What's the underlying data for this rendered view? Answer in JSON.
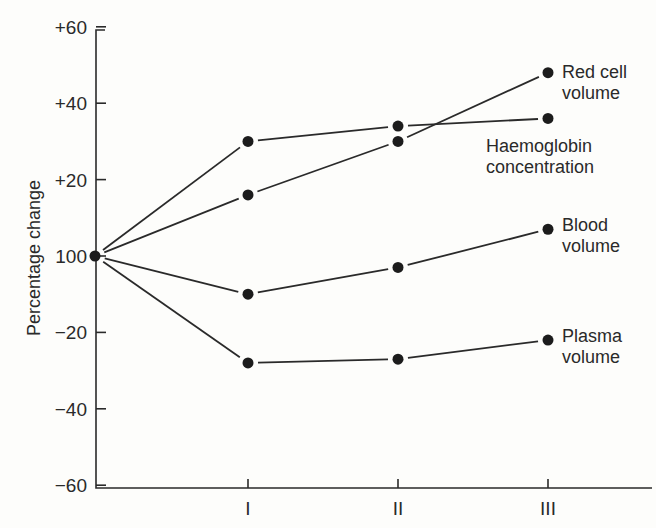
{
  "chart_data": {
    "type": "line",
    "title": "",
    "xlabel": "",
    "ylabel": "Percentage change",
    "x": [
      "",
      "I",
      "II",
      "III"
    ],
    "x_tick_labels": [
      "I",
      "II",
      "III"
    ],
    "y_tick_labels": [
      "+60",
      "+40",
      "+20",
      "100",
      "-20",
      "-40",
      "-60"
    ],
    "y_tick_values": [
      60,
      40,
      20,
      0,
      -20,
      -40,
      -60
    ],
    "ylim": [
      -60,
      60
    ],
    "grid": false,
    "legend_position": "inline-right",
    "series": [
      {
        "name": "Red cell volume",
        "label_lines": [
          "Red cell",
          "volume"
        ],
        "values": [
          0,
          16,
          30,
          48
        ]
      },
      {
        "name": "Haemoglobin concentration",
        "label_lines": [
          "Haemoglobin",
          "concentration"
        ],
        "values": [
          0,
          30,
          34,
          36
        ]
      },
      {
        "name": "Blood volume",
        "label_lines": [
          "Blood",
          "volume"
        ],
        "values": [
          0,
          -10,
          -3,
          7
        ]
      },
      {
        "name": "Plasma volume",
        "label_lines": [
          "Plasma",
          "volume"
        ],
        "values": [
          0,
          -28,
          -27,
          -22
        ]
      }
    ]
  }
}
